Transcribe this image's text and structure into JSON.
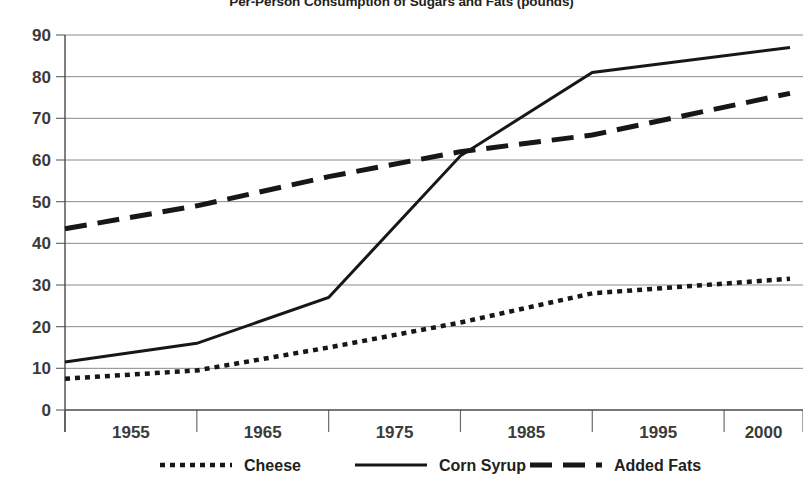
{
  "chart_data": {
    "type": "line",
    "title": "Per-Person Consumption of Sugars and Fats (pounds)",
    "xlabel": "",
    "ylabel": "",
    "x": [
      1955,
      1965,
      1975,
      1985,
      1995,
      2000
    ],
    "categories": [
      "1955",
      "1965",
      "1975",
      "1985",
      "1995",
      "2000"
    ],
    "xtick_labels": [
      "1955",
      "1965",
      "1975",
      "1985",
      "1995",
      "2000"
    ],
    "ytick_labels": [
      "0",
      "10",
      "20",
      "30",
      "40",
      "50",
      "60",
      "70",
      "80",
      "90"
    ],
    "yticks": [
      0,
      10,
      20,
      30,
      40,
      50,
      60,
      70,
      80,
      90
    ],
    "ylim": [
      0,
      90
    ],
    "grid": "horizontal",
    "legend_position": "bottom",
    "series": [
      {
        "name": "Cheese",
        "style": "dotted",
        "color": "#17171a",
        "values": [
          7.5,
          9.5,
          15.0,
          21.0,
          28.0,
          31.5
        ]
      },
      {
        "name": "Corn Syrup",
        "style": "solid",
        "color": "#17171a",
        "values": [
          11.5,
          16.0,
          27.0,
          61.0,
          81.0,
          87.0
        ]
      },
      {
        "name": "Added Fats",
        "style": "dashed",
        "color": "#17171a",
        "values": [
          43.5,
          49.0,
          56.0,
          62.0,
          66.0,
          76.0
        ]
      }
    ]
  },
  "legend": {
    "items": [
      {
        "label": "Cheese",
        "style": "dotted"
      },
      {
        "label": "Corn Syrup",
        "style": "solid"
      },
      {
        "label": "Added Fats",
        "style": "dashed"
      }
    ]
  },
  "axes": {
    "y_labels": [
      "90",
      "80",
      "70",
      "60",
      "50",
      "40",
      "30",
      "20",
      "10",
      "0"
    ],
    "x_labels": [
      "1955",
      "1965",
      "1975",
      "1985",
      "1995",
      "2000"
    ]
  }
}
